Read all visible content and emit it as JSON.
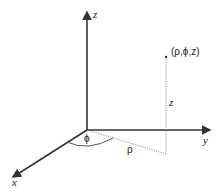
{
  "diagram": {
    "axes": {
      "x": {
        "label": "x"
      },
      "y": {
        "label": "y"
      },
      "z": {
        "label": "z"
      }
    },
    "point": {
      "label": "(ρ,ϕ,z)"
    },
    "annotations": {
      "rho": "ρ",
      "phi": "ϕ",
      "height": "z"
    },
    "colors": {
      "axis": "#333333",
      "dotted": "#777777",
      "text": "#222222"
    }
  }
}
